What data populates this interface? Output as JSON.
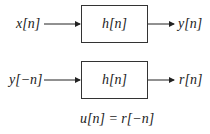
{
  "diagram": {
    "row1": {
      "input": "x[n]",
      "system": "h[n]",
      "output": "y[n]"
    },
    "row2": {
      "input": "y[−n]",
      "system": "h[n]",
      "output": "r[n]"
    },
    "equation": "u[n] = r[−n]"
  }
}
